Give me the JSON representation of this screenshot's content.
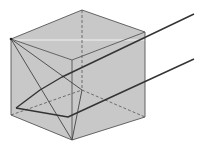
{
  "figure": {
    "title": ""
  },
  "colors": {
    "cube_fill": "#c8c8c8",
    "edge": "#555555",
    "ray": "#333333",
    "highlight": "#f2f2f2"
  }
}
